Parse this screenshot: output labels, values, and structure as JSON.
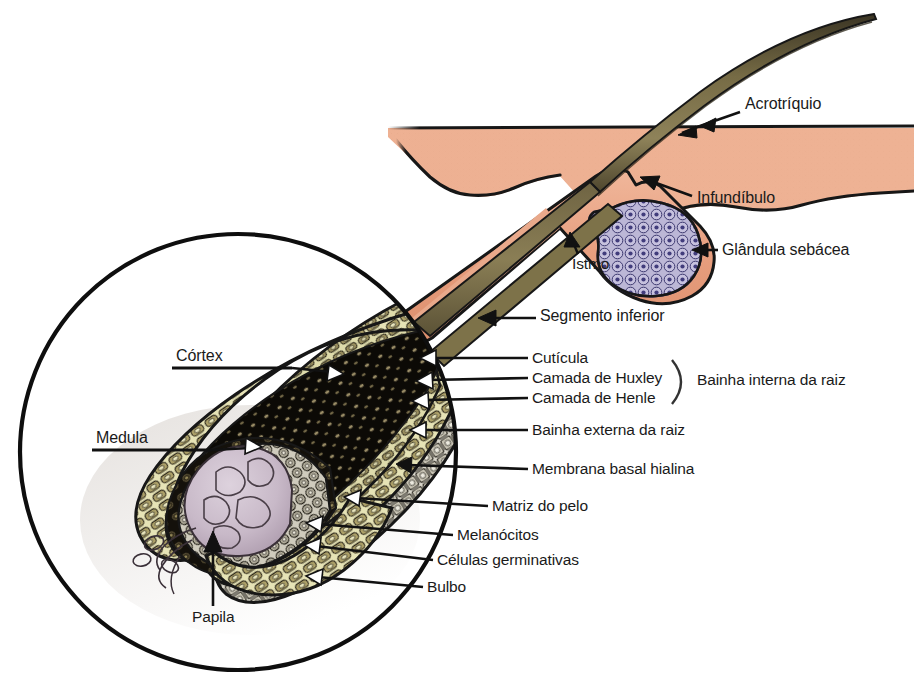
{
  "figure": {
    "language": "pt-BR",
    "style": "illustrated anatomical cross-section with magnifier inset"
  },
  "palette": {
    "skin": "#edb092",
    "skin_shadow": "#e3a184",
    "outline": "#171717",
    "hair_shaft_dark": "#5d5438",
    "hair_shaft_light": "#8b8059",
    "sheath_pink": "#e7a183",
    "gland_fill": "#b9b4d4",
    "gland_nucleus": "#4b4782",
    "cortex_cream": "#e4e2b4",
    "cortex_olive": "#a79b62",
    "medulla_black": "#100d08",
    "papilla": "#c6b7c6",
    "label_text": "#1a1a1a",
    "background": "#ffffff"
  },
  "labels": {
    "acrotriquio": "Acrotríquio",
    "infundibulo": "Infundíbulo",
    "glandula_sebacea": "Glândula sebácea",
    "istmo": "Istmo",
    "segmento_inferior": "Segmento inferior",
    "cutucula": "Cutícula",
    "camada_huxley": "Camada de Huxley",
    "camada_henle": "Camada de Henle",
    "bainha_interna": "Bainha interna da raiz",
    "bainha_externa": "Bainha externa da raiz",
    "membrana_basal": "Membrana basal hialina",
    "matriz_pelo": "Matriz do pelo",
    "melanocitos": "Melanócitos",
    "celulas_germinativas": "Células germinativas",
    "bulbo": "Bulbo",
    "cortex": "Córtex",
    "medula": "Medula",
    "papila": "Papila"
  },
  "label_list": [
    {
      "key": "acrotriquio",
      "text": "Acrotríquio",
      "x": 745,
      "y": 104,
      "marker": "arrow-left",
      "size": 16
    },
    {
      "key": "infundibulo",
      "text": "Infundíbulo",
      "x": 697,
      "y": 198,
      "marker": "arrow-upleft",
      "size": 16
    },
    {
      "key": "glandula_sebacea",
      "text": "Glândula sebácea",
      "x": 722,
      "y": 250,
      "marker": "arrow-left",
      "size": 16
    },
    {
      "key": "istmo",
      "text": "Istmo",
      "x": 572,
      "y": 262,
      "marker": "arrow-up",
      "size": 15
    },
    {
      "key": "segmento_inferior",
      "text": "Segmento inferior",
      "x": 540,
      "y": 313,
      "marker": "leader-left",
      "size": 16
    },
    {
      "key": "cutucula",
      "text": "Cutícula",
      "x": 532,
      "y": 362,
      "marker": "leader-left",
      "size": 15
    },
    {
      "key": "camada_huxley",
      "text": "Camada de Huxley",
      "x": 532,
      "y": 382,
      "marker": "leader-left",
      "size": 15
    },
    {
      "key": "camada_henle",
      "text": "Camada de Henle",
      "x": 532,
      "y": 402,
      "marker": "leader-left",
      "size": 15
    },
    {
      "key": "bainha_interna",
      "text": "Bainha interna da raiz",
      "x": 697,
      "y": 382,
      "marker": "brace",
      "size": 15
    },
    {
      "key": "bainha_externa",
      "text": "Bainha externa da raiz",
      "x": 532,
      "y": 434,
      "marker": "leader-left",
      "size": 15
    },
    {
      "key": "membrana_basal",
      "text": "Membrana basal hialina",
      "x": 532,
      "y": 473,
      "marker": "leader-left",
      "size": 15
    },
    {
      "key": "matriz_pelo",
      "text": "Matriz do pelo",
      "x": 492,
      "y": 510,
      "marker": "leader-left",
      "size": 15
    },
    {
      "key": "melanocitos",
      "text": "Melanócitos",
      "x": 457,
      "y": 539,
      "marker": "leader-left",
      "size": 15
    },
    {
      "key": "celulas_germinativas",
      "text": "Células germinativas",
      "x": 437,
      "y": 564,
      "marker": "leader-left",
      "size": 15
    },
    {
      "key": "bulbo",
      "text": "Bulbo",
      "x": 427,
      "y": 591,
      "marker": "leader-left",
      "size": 15
    },
    {
      "key": "cortex",
      "text": "Córtex",
      "x": 176,
      "y": 357,
      "marker": "leader-right",
      "size": 16
    },
    {
      "key": "medula",
      "text": "Medula",
      "x": 96,
      "y": 438,
      "marker": "leader-right",
      "size": 16
    },
    {
      "key": "papila",
      "text": "Papila",
      "x": 192,
      "y": 618,
      "marker": "arrow-up",
      "size": 15
    }
  ],
  "structures": {
    "magnifier_circle": {
      "cx": 238,
      "cy": 452,
      "r": 219
    },
    "epidermis_band": {
      "from_x": 388,
      "to_x": 914,
      "top_y": 122,
      "thickness": 56
    },
    "sebaceous_gland": {
      "cx": 660,
      "cy": 250
    },
    "hair_shaft_tip": {
      "x": 880,
      "y": 20
    },
    "bulb_center": {
      "x": 215,
      "y": 530
    }
  }
}
